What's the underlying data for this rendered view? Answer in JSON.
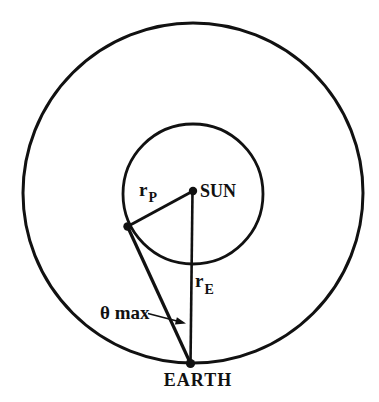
{
  "figure": {
    "labels": {
      "sun": "SUN",
      "earth": "EARTH",
      "r_p_base": "r",
      "r_p_sub": "P",
      "r_e_base": "r",
      "r_e_sub": "E",
      "theta_max": "θ max"
    },
    "colors": {
      "background": "#ffffff",
      "line": "#111111"
    },
    "diagram": {
      "type": "orbital-geometry",
      "points": [
        "SUN",
        "EARTH",
        "tangent-point-on-inner-orbit"
      ],
      "circles": [
        "outer-orbit",
        "inner-orbit"
      ],
      "segments": [
        "r_P (SUN to tangent point)",
        "r_E (SUN to EARTH)",
        "tangent line (EARTH to tangent point)"
      ],
      "angle": "θ max at EARTH between r_E and tangent line"
    }
  }
}
